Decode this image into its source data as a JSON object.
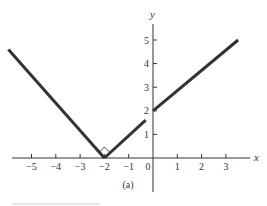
{
  "chart_data": {
    "type": "line",
    "title": "",
    "caption": "(a)",
    "xlabel": "x",
    "ylabel": "y",
    "xlim": [
      -6.0,
      3.6
    ],
    "ylim": [
      -1.3,
      5.6
    ],
    "grid": false,
    "legend": null,
    "x_ticks": [
      -5,
      -4,
      -3,
      -2,
      -1,
      0,
      1,
      2,
      3
    ],
    "x_tick_labels": [
      "−5",
      "−4",
      "−3",
      "−2",
      "−1",
      "0",
      "1",
      "2",
      "3"
    ],
    "y_ticks": [
      1,
      2,
      3,
      4,
      5
    ],
    "y_tick_labels": [
      "1",
      "2",
      "3",
      "4",
      "5"
    ],
    "series": [
      {
        "name": "left branch",
        "points": [
          [
            -5.95,
            4.6
          ],
          [
            -2,
            0
          ]
        ]
      },
      {
        "name": "middle segment (open at x=0)",
        "points": [
          [
            -2,
            0
          ],
          [
            -0.3,
            1.6
          ]
        ]
      },
      {
        "name": "right branch",
        "points": [
          [
            0,
            2
          ],
          [
            3.5,
            5
          ]
        ]
      }
    ],
    "annotations": [
      {
        "type": "right-angle-marker",
        "at": [
          -2,
          0
        ],
        "text": ""
      }
    ],
    "line_color": "#333333"
  }
}
